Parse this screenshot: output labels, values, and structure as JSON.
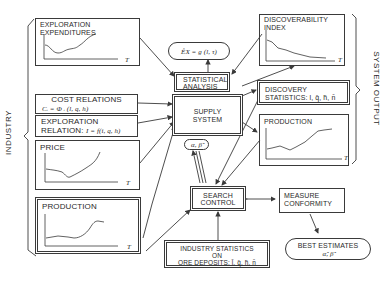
{
  "side_labels": {
    "left": "INDUSTRY",
    "right": "SYSTEM OUTPUT"
  },
  "boxes": {
    "exploration_expenditures": {
      "title_line1": "EXPLORATION",
      "title_line2": "EXPENDITURES",
      "axis_label": "T"
    },
    "cost_relations": {
      "title": "COST RELATIONS",
      "formula": "Cᵢ = Φ ᵢ (l, q, h)"
    },
    "exploration_relation": {
      "title_line1": "EXPLORATION",
      "title_line2": "RELATION:",
      "formula": "I = f(i, q, h)"
    },
    "price": {
      "title": "PRICE",
      "axis_label": "T"
    },
    "production_left": {
      "title": "PRODUCTION",
      "axis_label": "T"
    },
    "statistical_analysis": {
      "line1": "STATISTICAL",
      "line2": "ANALYSIS"
    },
    "ex_formula": {
      "text": "ÊX = g (l, τ)"
    },
    "supply_system": {
      "line1": "SUPPLY",
      "line2": "SYSTEM"
    },
    "alpha_beta": {
      "text": "α, β̂"
    },
    "search_control": {
      "line1": "SEARCH",
      "line2": "CONTROL"
    },
    "industry_statistics": {
      "line1": "INDUSTRY STATISTICS",
      "line2": "ON",
      "line3": "ORE DEPOSITS: l̄, q̄, h̄, n̄"
    },
    "discoverability_index": {
      "title_line1": "DISCOVERABILITY",
      "title_line2": "INDEX",
      "axis_label": "T"
    },
    "discovery_statistics": {
      "title_line1": "DISCOVERY",
      "title_line2": "STATISTICS: l, q̄, h̄, n̄"
    },
    "production_right": {
      "title": "PRODUCTION",
      "axis_label": "T"
    },
    "measure_conformity": {
      "line1": "MEASURE",
      "line2": "CONFORMITY"
    },
    "best_estimates": {
      "line1": "BEST ESTIMATES",
      "line2": "α̂, β̂"
    }
  },
  "colors": {
    "ink": "#3a3a3a",
    "background": "#ffffff"
  }
}
